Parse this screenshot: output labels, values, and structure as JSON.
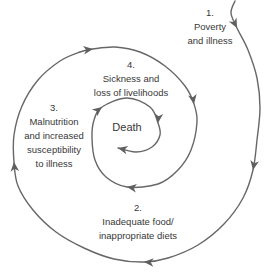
{
  "diagram": {
    "type": "cycle-spiral",
    "center": {
      "text": "Death"
    },
    "stages": [
      {
        "id": "1",
        "text": "1.\nPoverty\nand illness"
      },
      {
        "id": "2",
        "text": "2.\nInadequate food/\ninappropriate diets"
      },
      {
        "id": "3",
        "text": "3.\nMalnutrition\nand increased\nsusceptibility\nto illness"
      },
      {
        "id": "4",
        "text": "4.\nSickness and\nloss of livelihoods"
      }
    ],
    "colors": {
      "line": "#676767",
      "arrow": "#5f5f5f",
      "text": "#373737",
      "background": "#ffffff"
    }
  }
}
